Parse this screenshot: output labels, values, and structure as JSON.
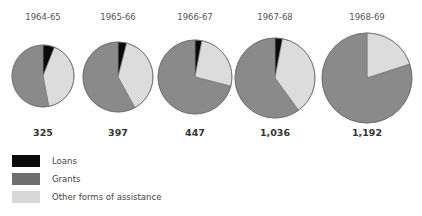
{
  "chart_data": {
    "type": "pie",
    "title": "",
    "series_names": [
      "Loans",
      "Grants",
      "Other forms of assistance"
    ],
    "colors": {
      "Loans": "#0a0a0a",
      "Grants": "#8a8a8a",
      "Other forms of assistance": "#dcdcdc",
      "outline": "#6f6f6f"
    },
    "pies": [
      {
        "label": "1964-65",
        "total": "325",
        "slices": {
          "Loans": 6,
          "Other forms of assistance": 41,
          "Grants": 53
        }
      },
      {
        "label": "1965-66",
        "total": "397",
        "slices": {
          "Loans": 4,
          "Other forms of assistance": 38,
          "Grants": 58
        }
      },
      {
        "label": "1966-67",
        "total": "447",
        "slices": {
          "Loans": 3,
          "Other forms of assistance": 26,
          "Grants": 71
        }
      },
      {
        "label": "1967-68",
        "total": "1,036",
        "slices": {
          "Loans": 3,
          "Other forms of assistance": 37,
          "Grants": 60
        }
      },
      {
        "label": "1968-69",
        "total": "1,192",
        "slices": {
          "Loans": 0,
          "Other forms of assistance": 20,
          "Grants": 80
        }
      }
    ],
    "slice_order_clockwise_from_top": [
      "Loans",
      "Other forms of assistance",
      "Grants"
    ],
    "legend_position": "bottom-left"
  },
  "legend": {
    "items": [
      {
        "label": "Loans"
      },
      {
        "label": "Grants"
      },
      {
        "label": "Other forms of assistance"
      }
    ]
  }
}
